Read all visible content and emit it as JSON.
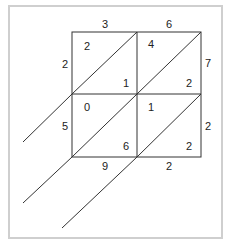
{
  "diagram": {
    "type": "lattice-multiplication",
    "multiplicand_digits": [
      "3",
      "6"
    ],
    "multiplier_digits": [
      "2",
      "5"
    ],
    "cells": [
      {
        "row": 0,
        "col": 0,
        "tens": "2",
        "ones": "1"
      },
      {
        "row": 0,
        "col": 1,
        "tens": "4",
        "ones": "2"
      },
      {
        "row": 1,
        "col": 0,
        "tens": "0",
        "ones": "6"
      },
      {
        "row": 1,
        "col": 1,
        "tens": "1",
        "ones": "2"
      }
    ],
    "right_side_digits": [
      "7",
      "2"
    ],
    "bottom_digits": [
      "9",
      "2"
    ],
    "colors": {
      "line": "#333333",
      "text": "#222222",
      "frame": "#cfcfcf",
      "background": "#ffffff"
    }
  }
}
